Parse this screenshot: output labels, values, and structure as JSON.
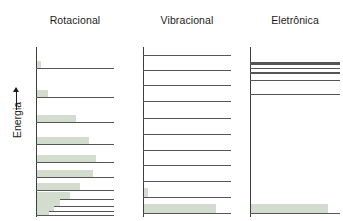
{
  "figure": {
    "axis_label": "Energia",
    "axis_arrow_icon": "up-arrow-icon",
    "background_color": "#ffffff",
    "level_line_color": "#555555",
    "axis_color": "#3d3d3d",
    "population_bar_color": "#d2ddcf"
  },
  "panels": [
    {
      "id": "rotational",
      "title": "Rotacional"
    },
    {
      "id": "vibrational",
      "title": "Vibracional"
    },
    {
      "id": "electronic",
      "title": "Eletrônica"
    }
  ],
  "chart_data": {
    "type": "bar",
    "title": "",
    "subtitle": "",
    "xlabel": "",
    "ylabel": "Energia",
    "grid": false,
    "legend_position": "none",
    "panels": [
      {
        "name": "Rotacional",
        "axis_x_px": 36,
        "axis_top_px": 47,
        "axis_bottom_px": 216,
        "level_line_right_px": 114,
        "levels": [
          {
            "index": 10,
            "y_px": 68,
            "line_width_px": 78,
            "population": 0.055
          },
          {
            "index": 9,
            "y_px": 97,
            "line_width_px": 78,
            "population": 0.14
          },
          {
            "index": 8,
            "y_px": 122,
            "line_width_px": 78,
            "population": 0.5
          },
          {
            "index": 7,
            "y_px": 144,
            "line_width_px": 78,
            "population": 0.67
          },
          {
            "index": 6,
            "y_px": 162,
            "line_width_px": 78,
            "population": 0.76
          },
          {
            "index": 5,
            "y_px": 177,
            "line_width_px": 78,
            "population": 0.72
          },
          {
            "index": 4,
            "y_px": 190,
            "line_width_px": 78,
            "population": 0.55
          },
          {
            "index": 3,
            "y_px": 199,
            "line_width_px": 78,
            "population": 0.42
          },
          {
            "index": 2,
            "y_px": 206,
            "line_width_px": 78,
            "population": 0.3
          },
          {
            "index": 1,
            "y_px": 211,
            "line_width_px": 78,
            "population": 0.22
          },
          {
            "index": 0,
            "y_px": 215,
            "line_width_px": 78,
            "population": 0.16
          }
        ]
      },
      {
        "name": "Vibracional",
        "axis_x_px": 143,
        "axis_top_px": 47,
        "axis_bottom_px": 216,
        "level_line_right_px": 88,
        "levels": [
          {
            "index": 10,
            "y_px": 55,
            "line_width_px": 88,
            "population": 0.0
          },
          {
            "index": 9,
            "y_px": 70,
            "line_width_px": 88,
            "population": 0.0
          },
          {
            "index": 8,
            "y_px": 85,
            "line_width_px": 88,
            "population": 0.0
          },
          {
            "index": 7,
            "y_px": 101,
            "line_width_px": 88,
            "population": 0.0
          },
          {
            "index": 6,
            "y_px": 118,
            "line_width_px": 88,
            "population": 0.0
          },
          {
            "index": 5,
            "y_px": 134,
            "line_width_px": 88,
            "population": 0.0
          },
          {
            "index": 4,
            "y_px": 150,
            "line_width_px": 88,
            "population": 0.0
          },
          {
            "index": 3,
            "y_px": 165,
            "line_width_px": 88,
            "population": 0.0
          },
          {
            "index": 2,
            "y_px": 181,
            "line_width_px": 88,
            "population": 0.0
          },
          {
            "index": 1,
            "y_px": 197,
            "line_width_px": 88,
            "population": 0.045
          },
          {
            "index": 0,
            "y_px": 213,
            "line_width_px": 88,
            "population": 0.82
          }
        ]
      },
      {
        "name": "Eletrônica",
        "axis_x_px": 250,
        "axis_top_px": 47,
        "axis_bottom_px": 216,
        "level_line_right_px": 90,
        "levels": [
          {
            "index": 4,
            "y_px": 62,
            "line_width_px": 90,
            "population": 0.0,
            "line_thickness_px": 3
          },
          {
            "index": 3,
            "y_px": 68,
            "line_width_px": 90,
            "population": 0.0,
            "line_thickness_px": 1
          },
          {
            "index": 2,
            "y_px": 72,
            "line_width_px": 90,
            "population": 0.0,
            "line_thickness_px": 1.6
          },
          {
            "index": 1,
            "y_px": 80,
            "line_width_px": 90,
            "population": 0.0,
            "line_thickness_px": 1
          },
          {
            "index": 0,
            "y_px": 94,
            "line_width_px": 90,
            "population": 0.0,
            "line_thickness_px": 1
          },
          {
            "index": -1,
            "y_px": 213,
            "line_width_px": 90,
            "population": 0.86,
            "line_thickness_px": 1
          }
        ]
      }
    ]
  }
}
